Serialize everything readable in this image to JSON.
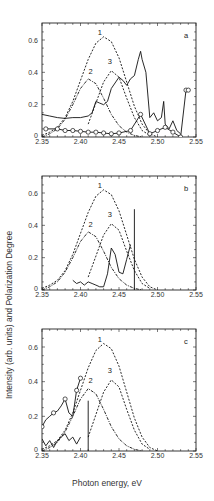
{
  "chart_data": [
    {
      "panel": "a",
      "type": "line",
      "title": "",
      "xlabel": "Photon energy, eV",
      "ylabel": "Intensity (arb. units) and Polarization Degree",
      "xlim": [
        2.35,
        2.55
      ],
      "ylim": [
        0,
        0.7
      ],
      "xticks": [
        "2.35",
        "2.40",
        "2.45",
        "2.50",
        "2.55"
      ],
      "yticks": [
        "0",
        "0.2",
        "0.4",
        "0.6"
      ],
      "grid": false,
      "legend": "none",
      "annotations": [
        "1",
        "2",
        "3",
        "a"
      ],
      "series": [
        {
          "name": "1",
          "style": "dashed",
          "x": [
            2.35,
            2.36,
            2.37,
            2.38,
            2.39,
            2.4,
            2.41,
            2.42,
            2.43,
            2.44,
            2.45,
            2.46,
            2.47,
            2.48,
            2.49,
            2.5
          ],
          "y": [
            0.01,
            0.03,
            0.06,
            0.12,
            0.22,
            0.35,
            0.48,
            0.58,
            0.62,
            0.59,
            0.49,
            0.34,
            0.19,
            0.08,
            0.02,
            0.0
          ]
        },
        {
          "name": "2",
          "style": "dash-dot",
          "x": [
            2.35,
            2.36,
            2.37,
            2.38,
            2.39,
            2.4,
            2.41,
            2.42,
            2.43,
            2.44,
            2.45,
            2.46,
            2.47,
            2.48
          ],
          "y": [
            0.0,
            0.02,
            0.05,
            0.11,
            0.2,
            0.3,
            0.36,
            0.33,
            0.24,
            0.14,
            0.07,
            0.03,
            0.01,
            0.0
          ]
        },
        {
          "name": "3",
          "style": "dashed",
          "x": [
            2.41,
            2.42,
            2.43,
            2.44,
            2.45,
            2.46,
            2.47,
            2.48,
            2.49
          ],
          "y": [
            0.08,
            0.21,
            0.34,
            0.41,
            0.37,
            0.24,
            0.12,
            0.04,
            0.01
          ]
        },
        {
          "name": "experimental intensity",
          "style": "solid",
          "x": [
            2.35,
            2.36,
            2.37,
            2.38,
            2.39,
            2.4,
            2.41,
            2.415,
            2.42,
            2.425,
            2.43,
            2.435,
            2.44,
            2.45,
            2.455,
            2.46,
            2.465,
            2.47,
            2.475,
            2.478,
            2.48,
            2.485,
            2.49,
            2.495,
            2.5,
            2.505,
            2.508,
            2.51,
            2.515,
            2.52,
            2.525,
            2.53
          ],
          "y": [
            0.14,
            0.13,
            0.12,
            0.115,
            0.12,
            0.12,
            0.13,
            0.15,
            0.22,
            0.21,
            0.2,
            0.22,
            0.3,
            0.37,
            0.35,
            0.32,
            0.36,
            0.38,
            0.48,
            0.53,
            0.48,
            0.4,
            0.12,
            0.15,
            0.1,
            0.12,
            0.22,
            0.08,
            0.05,
            0.1,
            0.04,
            0.02
          ]
        },
        {
          "name": "polarization degree",
          "style": "solid-circles",
          "x": [
            2.355,
            2.37,
            2.38,
            2.39,
            2.4,
            2.41,
            2.42,
            2.43,
            2.44,
            2.45,
            2.465,
            2.478,
            2.49,
            2.5,
            2.51,
            2.52,
            2.53,
            2.537,
            2.54
          ],
          "y": [
            0.05,
            0.05,
            0.04,
            0.04,
            0.035,
            0.03,
            0.03,
            0.025,
            0.02,
            0.025,
            0.04,
            0.14,
            0.02,
            0.04,
            0.06,
            0.03,
            0.0,
            0.29,
            0.29
          ]
        }
      ]
    },
    {
      "panel": "b",
      "type": "line",
      "xlim": [
        2.35,
        2.55
      ],
      "ylim": [
        0,
        0.7
      ],
      "xticks": [
        "2.35",
        "2.40",
        "2.45",
        "2.50",
        "2.55"
      ],
      "yticks": [
        "0",
        "0.2",
        "0.4",
        "0.6"
      ],
      "annotations": [
        "1",
        "2",
        "3",
        "b"
      ],
      "series": [
        {
          "name": "1",
          "style": "dashed",
          "x": [
            2.35,
            2.36,
            2.37,
            2.38,
            2.39,
            2.4,
            2.41,
            2.42,
            2.43,
            2.44,
            2.45,
            2.46,
            2.47,
            2.48,
            2.49,
            2.5
          ],
          "y": [
            0.01,
            0.03,
            0.06,
            0.12,
            0.22,
            0.35,
            0.48,
            0.58,
            0.62,
            0.59,
            0.49,
            0.34,
            0.19,
            0.08,
            0.02,
            0.0
          ]
        },
        {
          "name": "2",
          "style": "dash-dot",
          "x": [
            2.35,
            2.36,
            2.37,
            2.38,
            2.39,
            2.4,
            2.41,
            2.42,
            2.43,
            2.44,
            2.45,
            2.46,
            2.47,
            2.48
          ],
          "y": [
            0.0,
            0.02,
            0.05,
            0.11,
            0.2,
            0.3,
            0.36,
            0.33,
            0.24,
            0.14,
            0.07,
            0.03,
            0.01,
            0.0
          ]
        },
        {
          "name": "3",
          "style": "dashed",
          "x": [
            2.41,
            2.42,
            2.43,
            2.44,
            2.45,
            2.46,
            2.47,
            2.48,
            2.49
          ],
          "y": [
            0.08,
            0.21,
            0.34,
            0.41,
            0.37,
            0.24,
            0.12,
            0.04,
            0.01
          ]
        },
        {
          "name": "experimental intensity",
          "style": "solid",
          "x": [
            2.39,
            2.395,
            2.4,
            2.405,
            2.41,
            2.415,
            2.42,
            2.425,
            2.43,
            2.435,
            2.44,
            2.445,
            2.45,
            2.455,
            2.46,
            2.465
          ],
          "y": [
            0.06,
            0.04,
            0.05,
            0.03,
            0.05,
            0.04,
            0.03,
            0.02,
            0.02,
            0.1,
            0.26,
            0.22,
            0.11,
            0.1,
            0.19,
            0.28
          ]
        },
        {
          "name": "line marker",
          "style": "vertical",
          "x": [
            2.47,
            2.47
          ],
          "y": [
            0,
            0.5
          ]
        }
      ]
    },
    {
      "panel": "c",
      "type": "line",
      "xlim": [
        2.35,
        2.55
      ],
      "ylim": [
        0,
        0.7
      ],
      "xticks": [
        "2.35",
        "2.40",
        "2.45",
        "2.50",
        "2.55"
      ],
      "yticks": [
        "0",
        "0.2",
        "0.4",
        "0.6"
      ],
      "annotations": [
        "1",
        "2",
        "3",
        "c"
      ],
      "series": [
        {
          "name": "1",
          "style": "dashed",
          "x": [
            2.35,
            2.36,
            2.37,
            2.38,
            2.39,
            2.4,
            2.41,
            2.42,
            2.43,
            2.44,
            2.45,
            2.46,
            2.47,
            2.48,
            2.49,
            2.5
          ],
          "y": [
            0.01,
            0.03,
            0.06,
            0.12,
            0.22,
            0.35,
            0.48,
            0.58,
            0.62,
            0.59,
            0.49,
            0.34,
            0.19,
            0.08,
            0.02,
            0.0
          ]
        },
        {
          "name": "2",
          "style": "dash-dot",
          "x": [
            2.35,
            2.36,
            2.37,
            2.38,
            2.39,
            2.4,
            2.41,
            2.42,
            2.43,
            2.44,
            2.45,
            2.46,
            2.47,
            2.48
          ],
          "y": [
            0.0,
            0.02,
            0.05,
            0.11,
            0.2,
            0.3,
            0.36,
            0.33,
            0.24,
            0.14,
            0.07,
            0.03,
            0.01,
            0.0
          ]
        },
        {
          "name": "3",
          "style": "dashed",
          "x": [
            2.41,
            2.42,
            2.43,
            2.44,
            2.45,
            2.46,
            2.47,
            2.48,
            2.49
          ],
          "y": [
            0.08,
            0.21,
            0.34,
            0.41,
            0.37,
            0.24,
            0.12,
            0.04,
            0.01
          ]
        },
        {
          "name": "polarization degree",
          "style": "solid-circles",
          "x": [
            2.35,
            2.355,
            2.36,
            2.365,
            2.37,
            2.375,
            2.38,
            2.385,
            2.39,
            2.395,
            2.4
          ],
          "y": [
            0.14,
            0.18,
            0.2,
            0.22,
            0.23,
            0.26,
            0.3,
            0.22,
            0.2,
            0.35,
            0.42
          ]
        },
        {
          "name": "experimental intensity",
          "style": "solid",
          "x": [
            2.35,
            2.355,
            2.36,
            2.365,
            2.37,
            2.375,
            2.38,
            2.385,
            2.39,
            2.395,
            2.4
          ],
          "y": [
            0.07,
            0.03,
            0.06,
            0.02,
            0.06,
            0.08,
            0.1,
            0.06,
            0.08,
            0.04,
            0.08
          ]
        },
        {
          "name": "line marker",
          "style": "vertical",
          "x": [
            2.41,
            2.41
          ],
          "y": [
            0,
            0.29
          ]
        }
      ]
    }
  ],
  "figure": {
    "ylabel": "Intensity (arb. units) and Polarization Degree",
    "xlabel": "Photon energy, eV",
    "panels": [
      {
        "letter": "a",
        "labels": {
          "c1": "1",
          "c2": "2",
          "c3": "3"
        }
      },
      {
        "letter": "b",
        "labels": {
          "c1": "1",
          "c2": "2",
          "c3": "3"
        }
      },
      {
        "letter": "c",
        "labels": {
          "c1": "1",
          "c2": "2",
          "c3": "3"
        }
      }
    ]
  }
}
